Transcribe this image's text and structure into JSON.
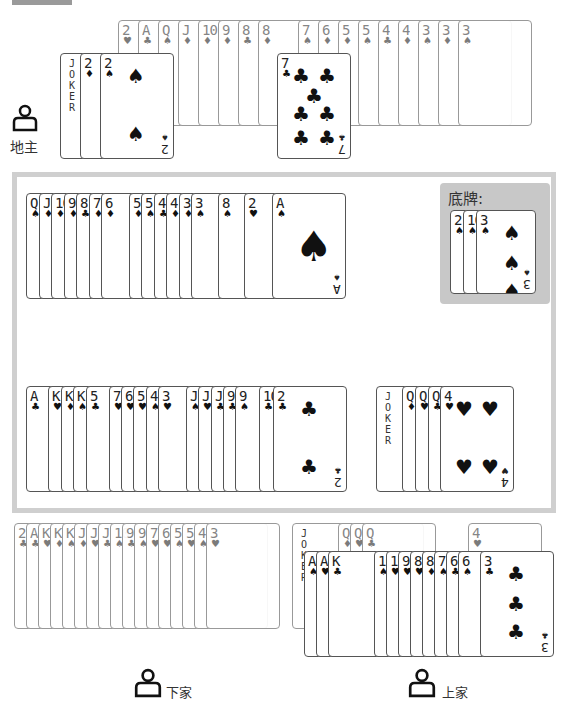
{
  "players": {
    "landlord": {
      "label": "地主",
      "icon": "user-icon"
    },
    "next": {
      "label": "下家",
      "icon": "user-icon"
    },
    "prev": {
      "label": "上家",
      "icon": "user-icon"
    }
  },
  "bottom_cards": {
    "label": "底牌:",
    "cards": [
      {
        "rank": "2",
        "suit": "♠"
      },
      {
        "rank": "10",
        "suit": "♠"
      },
      {
        "rank": "3",
        "suit": "♠"
      }
    ]
  },
  "landlord_hand": {
    "back_row": [
      {
        "rank": "2",
        "suit": "♥"
      },
      {
        "rank": "A",
        "suit": "♣"
      },
      {
        "rank": "Q",
        "suit": "♠"
      },
      {
        "rank": "J",
        "suit": "♦"
      },
      {
        "rank": "10",
        "suit": "♦"
      },
      {
        "rank": "9",
        "suit": "♦"
      },
      {
        "rank": "8",
        "suit": "♣"
      },
      {
        "rank": "8",
        "suit": "♦"
      },
      {
        "rank": "7",
        "suit": "♠"
      },
      {
        "rank": "6",
        "suit": "♦"
      },
      {
        "rank": "5",
        "suit": "♦"
      },
      {
        "rank": "5",
        "suit": "♠"
      },
      {
        "rank": "4",
        "suit": "♣"
      },
      {
        "rank": "4",
        "suit": "♦"
      },
      {
        "rank": "3",
        "suit": "♠"
      },
      {
        "rank": "3",
        "suit": "♦"
      },
      {
        "rank": "3",
        "suit": "♠"
      }
    ],
    "front_row": [
      {
        "rank": "JOKER",
        "suit": ""
      },
      {
        "rank": "2",
        "suit": "♦"
      },
      {
        "rank": "2",
        "suit": "♠"
      }
    ],
    "single": {
      "rank": "7",
      "suit": "♣"
    }
  },
  "table": {
    "row1": [
      {
        "rank": "Q",
        "suit": "♠"
      },
      {
        "rank": "J",
        "suit": "♦"
      },
      {
        "rank": "10",
        "suit": "♦"
      },
      {
        "rank": "9",
        "suit": "♦"
      },
      {
        "rank": "8",
        "suit": "♣"
      },
      {
        "rank": "7",
        "suit": "♦"
      },
      {
        "rank": "6",
        "suit": "♦"
      },
      {
        "rank": "5",
        "suit": "♦"
      },
      {
        "rank": "5",
        "suit": "♠"
      },
      {
        "rank": "4",
        "suit": "♣"
      },
      {
        "rank": "4",
        "suit": "♦"
      },
      {
        "rank": "3",
        "suit": "♦"
      },
      {
        "rank": "3",
        "suit": "♠"
      },
      {
        "rank": "8",
        "suit": "♠"
      },
      {
        "rank": "2",
        "suit": "♥"
      },
      {
        "rank": "A",
        "suit": "♠"
      }
    ],
    "row2_left": [
      {
        "rank": "A",
        "suit": "♣"
      },
      {
        "rank": "K",
        "suit": "♥"
      },
      {
        "rank": "K",
        "suit": "♦"
      },
      {
        "rank": "K",
        "suit": "♠"
      },
      {
        "rank": "5",
        "suit": "♣"
      },
      {
        "rank": "7",
        "suit": "♥"
      },
      {
        "rank": "6",
        "suit": "♥"
      },
      {
        "rank": "5",
        "suit": "♥"
      },
      {
        "rank": "4",
        "suit": "♠"
      },
      {
        "rank": "3",
        "suit": "♥"
      },
      {
        "rank": "J",
        "suit": "♠"
      },
      {
        "rank": "J",
        "suit": "♥"
      },
      {
        "rank": "J",
        "suit": "♣"
      },
      {
        "rank": "9",
        "suit": "♣"
      },
      {
        "rank": "9",
        "suit": "♠"
      },
      {
        "rank": "10",
        "suit": "♣"
      },
      {
        "rank": "2",
        "suit": "♣"
      }
    ],
    "row2_right": [
      {
        "rank": "JOKER",
        "suit": ""
      },
      {
        "rank": "Q",
        "suit": "♦"
      },
      {
        "rank": "Q",
        "suit": "♥"
      },
      {
        "rank": "Q",
        "suit": "♣"
      },
      {
        "rank": "4",
        "suit": "♥"
      }
    ]
  },
  "next_hand": [
    {
      "rank": "2",
      "suit": "♣"
    },
    {
      "rank": "A",
      "suit": "♣"
    },
    {
      "rank": "K",
      "suit": "♥"
    },
    {
      "rank": "K",
      "suit": "♦"
    },
    {
      "rank": "K",
      "suit": "♠"
    },
    {
      "rank": "J",
      "suit": "♦"
    },
    {
      "rank": "J",
      "suit": "♥"
    },
    {
      "rank": "J",
      "suit": "♣"
    },
    {
      "rank": "10",
      "suit": "♠"
    },
    {
      "rank": "9",
      "suit": "♣"
    },
    {
      "rank": "9",
      "suit": "♠"
    },
    {
      "rank": "7",
      "suit": "♥"
    },
    {
      "rank": "6",
      "suit": "♥"
    },
    {
      "rank": "5",
      "suit": "♠"
    },
    {
      "rank": "5",
      "suit": "♥"
    },
    {
      "rank": "4",
      "suit": "♠"
    },
    {
      "rank": "3",
      "suit": "♥"
    }
  ],
  "prev_hand": {
    "back_row": [
      {
        "rank": "JOKER",
        "suit": ""
      },
      {
        "rank": "Q",
        "suit": "♦"
      },
      {
        "rank": "Q",
        "suit": "♥"
      },
      {
        "rank": "Q",
        "suit": "♣"
      },
      {
        "rank": "4",
        "suit": "♥"
      }
    ],
    "front_row": [
      {
        "rank": "A",
        "suit": "♠"
      },
      {
        "rank": "A",
        "suit": "♥"
      },
      {
        "rank": "K",
        "suit": "♣"
      },
      {
        "rank": "10",
        "suit": "♠"
      },
      {
        "rank": "10",
        "suit": "♥"
      },
      {
        "rank": "9",
        "suit": "♥"
      },
      {
        "rank": "8",
        "suit": "♥"
      },
      {
        "rank": "8",
        "suit": "♦"
      },
      {
        "rank": "7",
        "suit": "♠"
      },
      {
        "rank": "6",
        "suit": "♣"
      },
      {
        "rank": "6",
        "suit": "♠"
      },
      {
        "rank": "3",
        "suit": "♣"
      }
    ]
  }
}
